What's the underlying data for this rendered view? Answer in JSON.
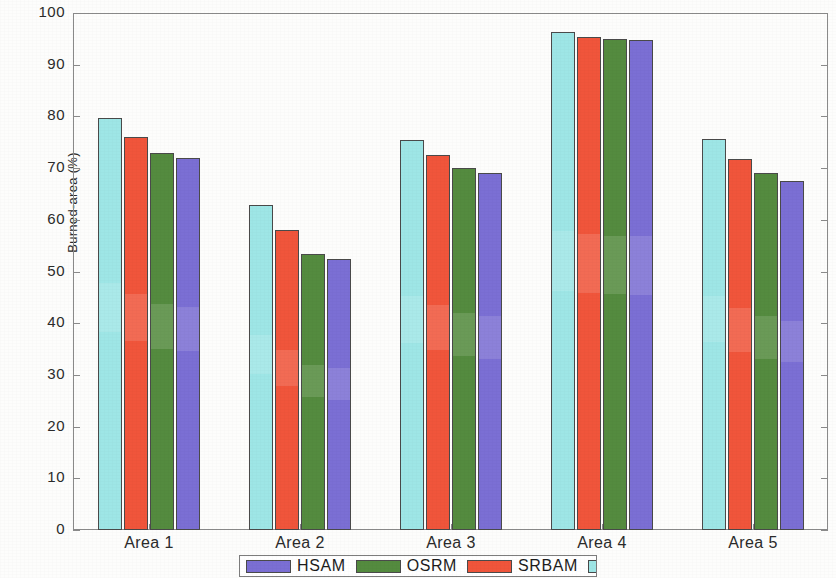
{
  "chart_data": {
    "type": "bar",
    "title": "",
    "xlabel": "",
    "ylabel": "Burned-area (%)",
    "ylim": [
      0,
      100
    ],
    "ytick_labels": [
      "0",
      "10",
      "20",
      "30",
      "40",
      "50",
      "60",
      "70",
      "80",
      "90",
      "100"
    ],
    "ytick_values": [
      0,
      10,
      20,
      30,
      40,
      50,
      60,
      70,
      80,
      90,
      100
    ],
    "categories": [
      "Area 1",
      "Area 2",
      "Area 3",
      "Area 4",
      "Area 5"
    ],
    "grid": false,
    "legend_position": "bottom-outside",
    "bar_draw_order": [
      "STI",
      "SRBAM",
      "OSRM",
      "HSAM"
    ],
    "series": [
      {
        "name": "HSAM",
        "color": "#7B6FD4",
        "values": [
          72.0,
          52.5,
          69.1,
          94.8,
          67.6
        ]
      },
      {
        "name": "OSRM",
        "color": "#548B3F",
        "values": [
          72.9,
          53.3,
          70.1,
          95.0,
          69.1
        ]
      },
      {
        "name": "SRBAM",
        "color": "#F0553B",
        "values": [
          76.1,
          58.1,
          72.5,
          95.4,
          71.8
        ]
      },
      {
        "name": "STI",
        "color": "#9EE6E6",
        "values": [
          79.7,
          62.9,
          75.5,
          96.3,
          75.6
        ]
      }
    ]
  },
  "legend": {
    "entries": [
      {
        "label": "HSAM",
        "color": "#7B6FD4"
      },
      {
        "label": "OSRM",
        "color": "#548B3F"
      },
      {
        "label": "SRBAM",
        "color": "#F0553B"
      },
      {
        "label": "STI",
        "color": "#9EE6E6"
      }
    ]
  },
  "axis_colors": {
    "frame": "#8a8a8a",
    "text": "#2b2b2b",
    "bar_outline": "#4a4a4a"
  }
}
